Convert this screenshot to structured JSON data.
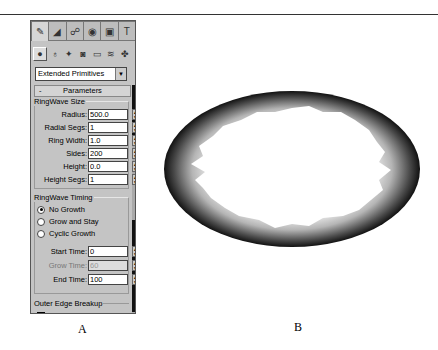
{
  "panel": {
    "tabs": [
      {
        "icon": "create-icon",
        "glyph": "✎",
        "active": true
      },
      {
        "icon": "modify-icon",
        "glyph": "◢",
        "active": false
      },
      {
        "icon": "hierarchy-icon",
        "glyph": "☍",
        "active": false
      },
      {
        "icon": "motion-icon",
        "glyph": "◉",
        "active": false
      },
      {
        "icon": "display-icon",
        "glyph": "▣",
        "active": false
      },
      {
        "icon": "utilities-icon",
        "glyph": "T",
        "active": false
      }
    ],
    "category_icons": [
      {
        "icon": "geometry-icon",
        "glyph": "●"
      },
      {
        "icon": "shapes-icon",
        "glyph": "♁"
      },
      {
        "icon": "lights-icon",
        "glyph": "✦"
      },
      {
        "icon": "cameras-icon",
        "glyph": "◙"
      },
      {
        "icon": "helpers-icon",
        "glyph": "▭"
      },
      {
        "icon": "space-warps-icon",
        "glyph": "≋"
      },
      {
        "icon": "systems-icon",
        "glyph": "✤"
      }
    ],
    "dropdown_value": "Extended Primitives",
    "rollout_label": "Parameters",
    "rollout_toggle": "-",
    "size_group": {
      "label": "RingWave Size",
      "fields": [
        {
          "label": "Radius:",
          "value": "500.0"
        },
        {
          "label": "Radial Segs:",
          "value": "1"
        },
        {
          "label": "Ring Width:",
          "value": "1.0"
        },
        {
          "label": "Sides:",
          "value": "200"
        },
        {
          "label": "Height:",
          "value": "0.0"
        },
        {
          "label": "Height Segs:",
          "value": "1"
        }
      ]
    },
    "timing_group": {
      "label": "RingWave Timing",
      "radios": [
        {
          "label": "No Growth",
          "checked": true
        },
        {
          "label": "Grow and Stay",
          "checked": false
        },
        {
          "label": "Cyclic Growth",
          "checked": false
        }
      ],
      "fields": [
        {
          "label": "Start Time:",
          "value": "0",
          "disabled": false
        },
        {
          "label": "Grow Time:",
          "value": "60",
          "disabled": true
        },
        {
          "label": "End Time:",
          "value": "100",
          "disabled": false
        }
      ]
    },
    "outer_group_label": "Outer Edge Breakup"
  },
  "captions": {
    "a": "A",
    "b": "B"
  }
}
